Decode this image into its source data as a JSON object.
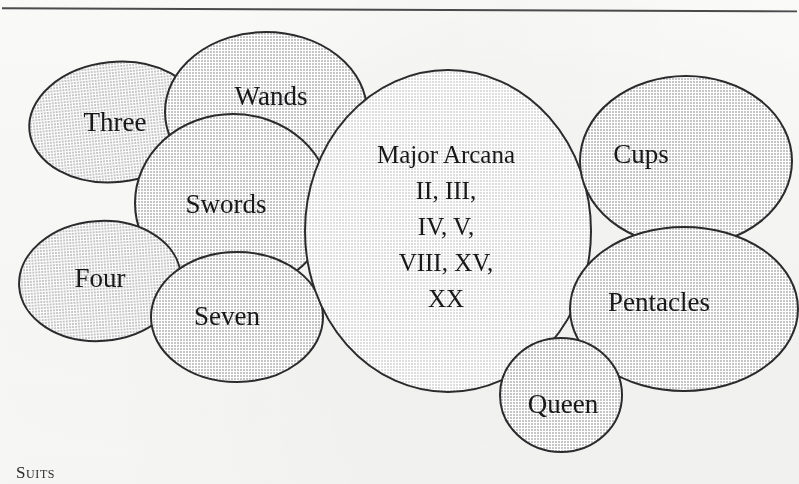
{
  "page": {
    "background_color": "#fdfdfc",
    "rule_color": "#4a4a4c"
  },
  "diagram": {
    "type": "overlapping-ellipse-venn",
    "title_caption": "Suits",
    "stroke_color": "#2b2b2d",
    "fill_color": "#cfcfcf",
    "highlight_fill_color": "#e4e4e4",
    "text_color": "#18181a",
    "ellipses": [
      {
        "id": "three",
        "name": "Three",
        "label_lines": [
          "Three"
        ],
        "cx": 115,
        "cy": 122,
        "rx": 86,
        "ry": 60,
        "rotation": -6,
        "fill": "#cfcfcf",
        "font_size": 27,
        "label_x": 115,
        "label_y": 131
      },
      {
        "id": "wands",
        "name": "Wands",
        "label_lines": [
          "Wands"
        ],
        "cx": 266,
        "cy": 112,
        "rx": 101,
        "ry": 80,
        "rotation": 0,
        "fill": "#cfcfcf",
        "font_size": 27,
        "label_x": 271,
        "label_y": 105
      },
      {
        "id": "swords",
        "name": "Swords",
        "label_lines": [
          "Swords"
        ],
        "cx": 233,
        "cy": 203,
        "rx": 98,
        "ry": 89,
        "rotation": 0,
        "fill": "#cfcfcf",
        "font_size": 27,
        "label_x": 226,
        "label_y": 213
      },
      {
        "id": "four",
        "name": "Four",
        "label_lines": [
          "Four"
        ],
        "cx": 100,
        "cy": 281,
        "rx": 81,
        "ry": 60,
        "rotation": -4,
        "fill": "#cfcfcf",
        "font_size": 27,
        "label_x": 100,
        "label_y": 287
      },
      {
        "id": "seven",
        "name": "Seven",
        "label_lines": [
          "Seven"
        ],
        "cx": 237,
        "cy": 317,
        "rx": 86,
        "ry": 65,
        "rotation": 0,
        "fill": "#cfcfcf",
        "font_size": 27,
        "label_x": 227,
        "label_y": 325
      },
      {
        "id": "major-arcana",
        "name": "Major Arcana",
        "label_lines": [
          "Major Arcana",
          "II, III,",
          "IV, V,",
          "VIII, XV,",
          "XX"
        ],
        "cx": 448,
        "cy": 231,
        "rx": 143,
        "ry": 161,
        "rotation": 0,
        "fill": "#e4e4e4",
        "font_size": 25,
        "label_x": 446,
        "label_y": 163,
        "line_height": 36
      },
      {
        "id": "cups",
        "name": "Cups",
        "label_lines": [
          "Cups"
        ],
        "cx": 686,
        "cy": 161,
        "rx": 106,
        "ry": 85,
        "rotation": 0,
        "fill": "#cfcfcf",
        "font_size": 27,
        "label_x": 641,
        "label_y": 163
      },
      {
        "id": "pentacles",
        "name": "Pentacles",
        "label_lines": [
          "Pentacles"
        ],
        "cx": 684,
        "cy": 309,
        "rx": 114,
        "ry": 82,
        "rotation": 0,
        "fill": "#cfcfcf",
        "font_size": 27,
        "label_x": 659,
        "label_y": 311
      },
      {
        "id": "queen",
        "name": "Queen",
        "label_lines": [
          "Queen"
        ],
        "cx": 561,
        "cy": 395,
        "rx": 61,
        "ry": 57,
        "rotation": 0,
        "fill": "#cfcfcf",
        "font_size": 27,
        "label_x": 563,
        "label_y": 413
      }
    ]
  },
  "caption": {
    "text": "Suits"
  }
}
